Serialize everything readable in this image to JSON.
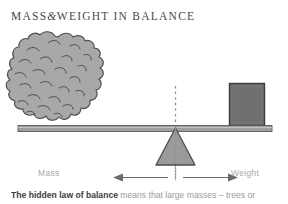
{
  "title": {
    "part1": "MASS",
    "ampersand": "&",
    "part2": "WEIGHT IN BALANCE"
  },
  "diagram": {
    "left_label": "Mass",
    "right_label": "Weight",
    "left_object": "tree-mass-blob",
    "right_object": "weight-block",
    "fulcrum": "triangle-fulcrum",
    "beam": "balance-beam",
    "center_line": "vertical-dashed-center-line",
    "left_arrow": "left-distance-arrow",
    "right_arrow": "right-distance-arrow",
    "colors": {
      "blob_fill": "#a8a8a8",
      "blob_stroke": "#4d4d4d",
      "beam_fill": "#9d9d9d",
      "beam_stroke": "#5a5a5a",
      "weight_fill": "#707070",
      "weight_stroke": "#3a3a3a",
      "fulcrum_fill": "#9a9a9a",
      "fulcrum_stroke": "#4d4d4d",
      "dash_color": "#8f8f8f",
      "arrow_color": "#6b6b6b",
      "label_color": "#a9a9a9",
      "title_color": "#4a4a4a",
      "caption_lead_color": "#3d3d3d",
      "caption_body_color": "#9b9b9b",
      "background": "#ffffff"
    }
  },
  "caption": {
    "lead": "The hidden law of balance",
    "body": " means that large masses – trees or"
  }
}
